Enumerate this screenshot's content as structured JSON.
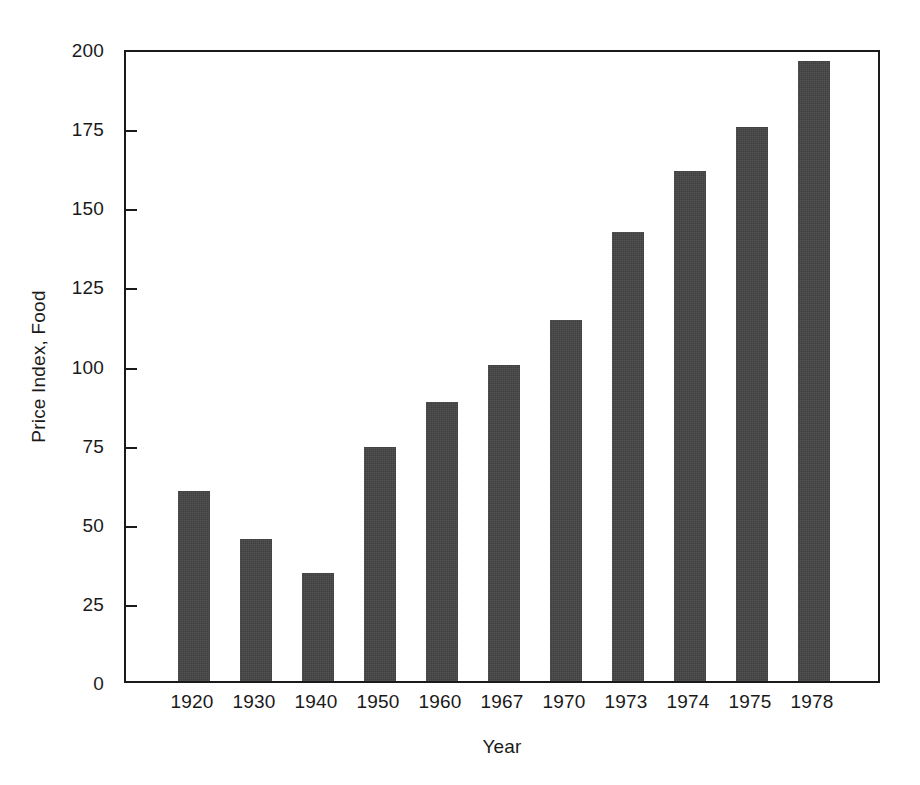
{
  "chart_data": {
    "type": "bar",
    "title": "",
    "subtitle": "",
    "xlabel": "Year",
    "ylabel": "Price Index, Food",
    "categories": [
      "1920",
      "1930",
      "1940",
      "1950",
      "1960",
      "1967",
      "1970",
      "1973",
      "1974",
      "1975",
      "1978"
    ],
    "values": [
      60,
      45,
      34,
      74,
      88,
      100,
      114,
      142,
      161,
      175,
      196
    ],
    "series": [
      {
        "name": "Price Index, Food",
        "values": [
          60,
          45,
          34,
          74,
          88,
          100,
          114,
          142,
          161,
          175,
          196
        ]
      }
    ],
    "ylim": [
      0,
      200
    ],
    "yticks": [
      0,
      25,
      50,
      75,
      100,
      125,
      150,
      175,
      200
    ],
    "ytick_labels": [
      "0",
      "25",
      "50",
      "75",
      "100",
      "125",
      "150",
      "175",
      "200"
    ],
    "xtick_labels": [
      "1920",
      "1930",
      "1940",
      "1950",
      "1960",
      "1967",
      "1970",
      "1973",
      "1974",
      "1975",
      "1978"
    ],
    "grid": false,
    "legend": false,
    "legend_position": "none",
    "annotations": [],
    "bar_color": "#454545",
    "axis_color": "#1a1a1a",
    "background_color": "#ffffff"
  }
}
